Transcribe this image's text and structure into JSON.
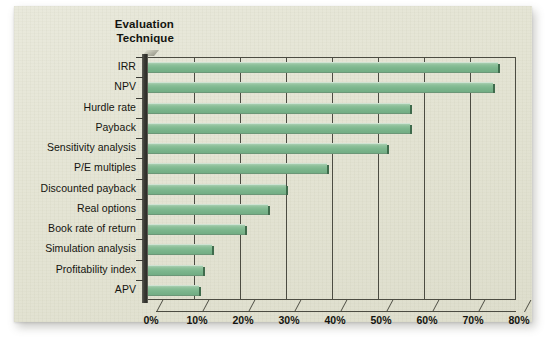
{
  "chart_data": {
    "type": "bar",
    "orientation": "horizontal",
    "title": "",
    "axis_title": "Evaluation Technique",
    "axis_title_lines": [
      "Evaluation",
      "Technique"
    ],
    "xlabel": "",
    "ylabel": "Evaluation Technique",
    "xlim": [
      0,
      80
    ],
    "xtick_labels": [
      "0%",
      "10%",
      "20%",
      "30%",
      "40%",
      "50%",
      "60%",
      "70%",
      "80%"
    ],
    "xtick_values": [
      0,
      10,
      20,
      30,
      40,
      50,
      60,
      70,
      80
    ],
    "grid": true,
    "grid_axis": "x",
    "legend": false,
    "units": "percent",
    "categories": [
      "IRR",
      "NPV",
      "Hurdle rate",
      "Payback",
      "Sensitivity analysis",
      "P/E multiples",
      "Discounted payback",
      "Real options",
      "Book rate of return",
      "Simulation analysis",
      "Profitability index",
      "APV"
    ],
    "values": [
      76,
      75,
      57,
      57,
      52,
      39,
      30,
      26,
      21,
      14,
      12,
      11
    ],
    "series": [
      {
        "name": "Percent of CFOs using technique",
        "color": "#7fb991",
        "values": [
          76,
          75,
          57,
          57,
          52,
          39,
          30,
          26,
          21,
          14,
          12,
          11
        ]
      }
    ]
  },
  "style": {
    "bar_color": "#7fb991",
    "bar_highlight": "#a8ceb0",
    "bar_edge": "#3f6b4c",
    "paper_color": "#e4e4d4",
    "axis_color": "#4c4c42",
    "spine_color": "#33332d",
    "text_color": "#14140f"
  }
}
